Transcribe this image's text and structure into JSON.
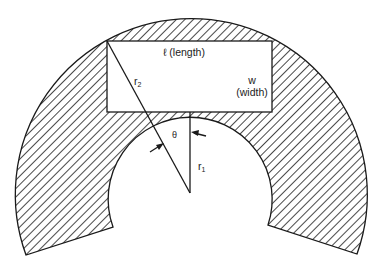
{
  "diagram": {
    "type": "geometric-figure",
    "labels": {
      "length": "ℓ (length)",
      "width_symbol": "w",
      "width_text": "(width)",
      "outer_radius": "r",
      "outer_radius_sub": "2",
      "inner_radius": "r",
      "inner_radius_sub": "1",
      "angle": "θ"
    },
    "colors": {
      "stroke": "#1a1a1a",
      "hatch": "#1a1a1a",
      "background": "#ffffff",
      "rect_fill": "#ffffff"
    }
  }
}
